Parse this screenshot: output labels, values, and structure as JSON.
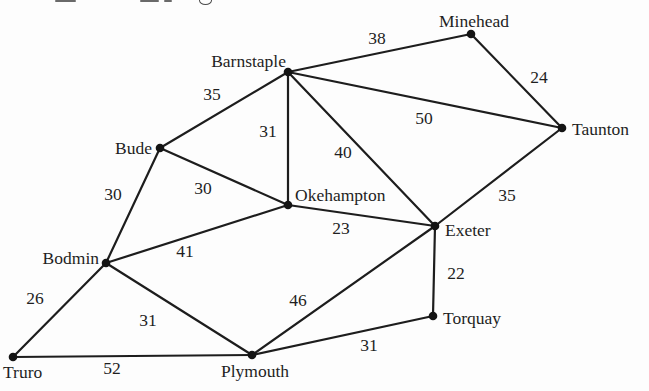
{
  "diagram": {
    "type": "weighted-graph",
    "background": "#fdfdfd",
    "ink_color": "#1d1d1d"
  },
  "graph": {
    "nodes": [
      {
        "id": "Minehead",
        "label": "Minehead",
        "x": 471,
        "y": 34,
        "tx": 474,
        "ty": 27,
        "anchor": "middle"
      },
      {
        "id": "Taunton",
        "label": "Taunton",
        "x": 562,
        "y": 128,
        "tx": 572,
        "ty": 135,
        "anchor": "start"
      },
      {
        "id": "Barnstaple",
        "label": "Barnstaple",
        "x": 288,
        "y": 72,
        "tx": 286,
        "ty": 67,
        "anchor": "end"
      },
      {
        "id": "Bude",
        "label": "Bude",
        "x": 160,
        "y": 148,
        "tx": 152,
        "ty": 154,
        "anchor": "end"
      },
      {
        "id": "Okehampton",
        "label": "Okehampton",
        "x": 288,
        "y": 205,
        "tx": 295,
        "ty": 201,
        "anchor": "start"
      },
      {
        "id": "Exeter",
        "label": "Exeter",
        "x": 435,
        "y": 226,
        "tx": 445,
        "ty": 236,
        "anchor": "start"
      },
      {
        "id": "Bodmin",
        "label": "Bodmin",
        "x": 106,
        "y": 263,
        "tx": 99,
        "ty": 264,
        "anchor": "end"
      },
      {
        "id": "Truro",
        "label": "Truro",
        "x": 13,
        "y": 357,
        "tx": 3,
        "ty": 378,
        "anchor": "start"
      },
      {
        "id": "Plymouth",
        "label": "Plymouth",
        "x": 252,
        "y": 355,
        "tx": 255,
        "ty": 377,
        "anchor": "middle"
      },
      {
        "id": "Torquay",
        "label": "Torquay",
        "x": 433,
        "y": 316,
        "tx": 443,
        "ty": 324,
        "anchor": "start"
      }
    ],
    "edges": [
      {
        "from": "Barnstaple",
        "to": "Minehead",
        "weight": "38",
        "lx": 377,
        "ly": 44
      },
      {
        "from": "Minehead",
        "to": "Taunton",
        "weight": "24",
        "lx": 539,
        "ly": 83
      },
      {
        "from": "Barnstaple",
        "to": "Taunton",
        "weight": "50",
        "lx": 424,
        "ly": 124
      },
      {
        "from": "Bude",
        "to": "Barnstaple",
        "weight": "35",
        "lx": 212,
        "ly": 100
      },
      {
        "from": "Barnstaple",
        "to": "Okehampton",
        "weight": "31",
        "lx": 268,
        "ly": 137
      },
      {
        "from": "Barnstaple",
        "to": "Exeter",
        "weight": "40",
        "lx": 343,
        "ly": 158
      },
      {
        "from": "Taunton",
        "to": "Exeter",
        "weight": "35",
        "lx": 507,
        "ly": 201
      },
      {
        "from": "Bude",
        "to": "Okehampton",
        "weight": "30",
        "lx": 203,
        "ly": 194
      },
      {
        "from": "Bude",
        "to": "Bodmin",
        "weight": "30",
        "lx": 113,
        "ly": 200
      },
      {
        "from": "Okehampton",
        "to": "Exeter",
        "weight": "23",
        "lx": 341,
        "ly": 234
      },
      {
        "from": "Bodmin",
        "to": "Okehampton",
        "weight": "41",
        "lx": 185,
        "ly": 257
      },
      {
        "from": "Truro",
        "to": "Bodmin",
        "weight": "26",
        "lx": 35,
        "ly": 304
      },
      {
        "from": "Bodmin",
        "to": "Plymouth",
        "weight": "31",
        "lx": 148,
        "ly": 326
      },
      {
        "from": "Truro",
        "to": "Plymouth",
        "weight": "52",
        "lx": 112,
        "ly": 374
      },
      {
        "from": "Plymouth",
        "to": "Exeter",
        "weight": "46",
        "lx": 298,
        "ly": 306
      },
      {
        "from": "Exeter",
        "to": "Torquay",
        "weight": "22",
        "lx": 456,
        "ly": 279
      },
      {
        "from": "Plymouth",
        "to": "Torquay",
        "weight": "31",
        "lx": 369,
        "ly": 351
      }
    ]
  }
}
